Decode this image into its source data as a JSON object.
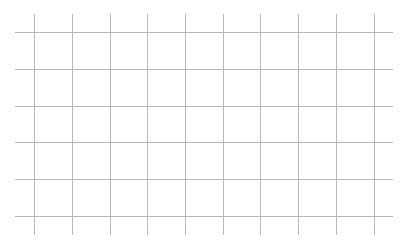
{
  "grid": {
    "line_color": "#b8b8b8",
    "background": "#ffffff",
    "vertical_lines_x": [
      34,
      72,
      110,
      147,
      185,
      223,
      260,
      298,
      336,
      374
    ],
    "vertical_extent": [
      14,
      235
    ],
    "horizontal_lines_y": [
      32,
      69,
      106,
      142,
      179,
      216
    ],
    "horizontal_extent": [
      15,
      393
    ]
  }
}
